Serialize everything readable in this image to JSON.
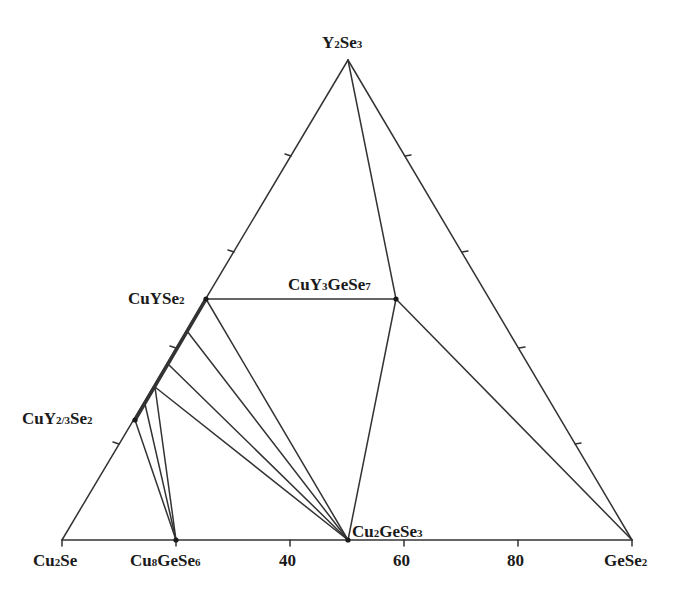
{
  "diagram": {
    "type": "ternary_phase_diagram",
    "system": "Cu2Se - GeSe2 - Y2Se3",
    "line_color": "#333333",
    "background": "#ffffff",
    "vertices": {
      "bottom_left": {
        "label": "Cu",
        "sub": "2",
        "rest": "Se",
        "formula": "Cu2Se"
      },
      "bottom_right": {
        "label": "GeSe",
        "sub": "2",
        "rest": "",
        "formula": "GeSe2"
      },
      "top": {
        "label": "Y",
        "sub": "2",
        "rest": "Se",
        "sub2": "3",
        "formula": "Y2Se3"
      }
    },
    "axis_tick_labels": [
      "40",
      "60",
      "80"
    ],
    "phases": [
      {
        "formula": "CuYSe2",
        "parts": [
          "CuYSe",
          "2"
        ]
      },
      {
        "formula": "CuY3GeSe7",
        "parts": [
          "CuY",
          "3",
          "GeSe",
          "7"
        ]
      },
      {
        "formula": "CuY2/3Se2",
        "parts": [
          "CuY",
          "2/3",
          "Se",
          "2"
        ]
      },
      {
        "formula": "Cu8GeSe6",
        "parts": [
          "Cu",
          "8",
          "GeSe",
          "6"
        ]
      },
      {
        "formula": "Cu2GeSe3",
        "parts": [
          "Cu",
          "2",
          "GeSe",
          "3"
        ]
      }
    ],
    "tie_lines": [
      [
        "CuYSe2",
        "CuY3GeSe7"
      ],
      [
        "Y2Se3",
        "Cu2GeSe3"
      ],
      [
        "CuY3GeSe7",
        "Cu2GeSe3"
      ],
      [
        "CuY3GeSe7",
        "GeSe2"
      ],
      [
        "CuYSe2",
        "Cu2GeSe3"
      ],
      [
        "solid-solution-1",
        "Cu2GeSe3"
      ],
      [
        "solid-solution-2",
        "Cu2GeSe3"
      ],
      [
        "solid-solution-3",
        "Cu2GeSe3"
      ],
      [
        "solid-solution-3",
        "Cu8GeSe6"
      ],
      [
        "solid-solution-4",
        "Cu8GeSe6"
      ],
      [
        "CuY2/3Se2",
        "Cu8GeSe6"
      ]
    ],
    "solid_solution_range": [
      "CuY2/3Se2",
      "CuYSe2"
    ]
  }
}
